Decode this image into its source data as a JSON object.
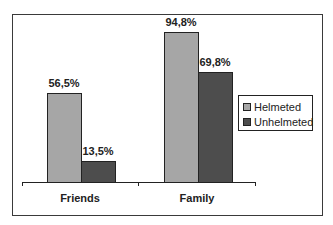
{
  "chart_data": {
    "type": "bar",
    "title": "",
    "xlabel": "",
    "ylabel": "",
    "categories": [
      "Friends",
      "Family"
    ],
    "series": [
      {
        "name": "Helmeted",
        "values": [
          56.5,
          94.8
        ],
        "labels": [
          "56,5%",
          "94,8%"
        ],
        "color": "#a6a6a6"
      },
      {
        "name": "Unhelmeted",
        "values": [
          13.5,
          69.8
        ],
        "labels": [
          "13,5%",
          "69,8%"
        ],
        "color": "#4d4d4d"
      }
    ],
    "ylim": [
      0,
      100
    ],
    "grid": false,
    "legend_position": "right",
    "value_format": "percent, comma decimal separator"
  },
  "legend": {
    "items": [
      "Helmeted",
      "Unhelmeted"
    ]
  }
}
